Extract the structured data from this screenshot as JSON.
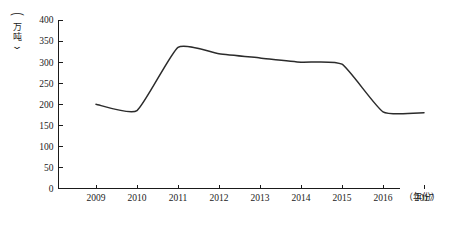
{
  "chart_data": {
    "type": "line",
    "title": "",
    "xlabel": "（年份）",
    "ylabel": "（万吨）",
    "categories": [
      "2009",
      "2010",
      "2011",
      "2012",
      "2013",
      "2014",
      "2015",
      "2016",
      "2017"
    ],
    "x": [
      2009,
      2010,
      2011,
      2012,
      2013,
      2014,
      2015,
      2016,
      2017
    ],
    "values": [
      200,
      185,
      335,
      320,
      310,
      300,
      295,
      182,
      180
    ],
    "series": [
      {
        "name": "",
        "values": [
          200,
          185,
          335,
          320,
          310,
          300,
          295,
          182,
          180
        ]
      }
    ],
    "ylim": [
      0,
      400
    ],
    "ytick_step": 50,
    "ytick_labels": [
      "0",
      "50",
      "100",
      "150",
      "200",
      "250",
      "300",
      "350",
      "400"
    ],
    "xlim": [
      2009,
      2017
    ],
    "grid": false,
    "legend": false,
    "legend_position": "none",
    "line_color": "#2b2b2b",
    "axis_color": "#1a1a1a",
    "background_color": "#ffffff",
    "annotations": []
  },
  "axes": {
    "y_unit_chars": [
      "万",
      "吨"
    ],
    "y_paren_open": "⌒",
    "y_paren_close": "⌄",
    "x_unit_text": "（年份）"
  }
}
